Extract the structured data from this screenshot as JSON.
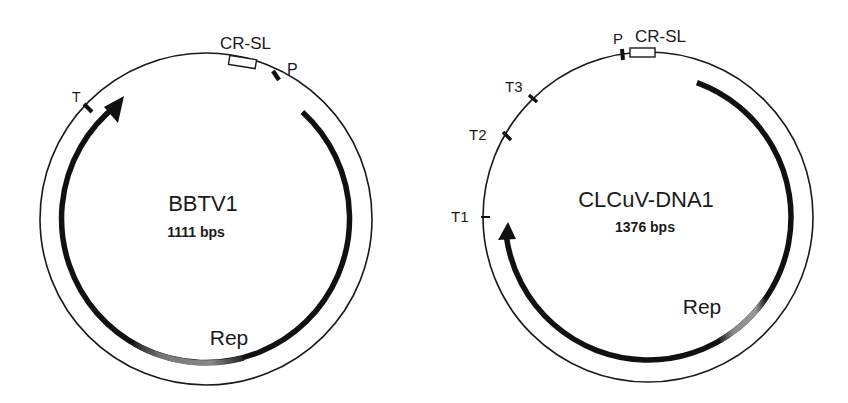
{
  "maps": [
    {
      "name": "BBTV1",
      "size": "1111 bps",
      "gene": "Rep",
      "features": {
        "terminator": "T",
        "stem_loop": "CR-SL",
        "promoter": "P"
      }
    },
    {
      "name": "CLCuV-DNA1",
      "size": "1376 bps",
      "gene": "Rep",
      "features": {
        "promoter": "P",
        "stem_loop": "CR-SL",
        "terminator_1": "T1",
        "terminator_2": "T2",
        "terminator_3": "T3"
      }
    }
  ],
  "colors": {
    "line": "#1a1a1a",
    "gene_arc": "#111111",
    "gene_fade": "#8a8a8a",
    "background": "#ffffff"
  }
}
